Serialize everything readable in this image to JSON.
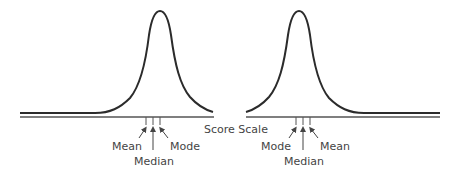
{
  "diagram": {
    "axis_label": "Score Scale",
    "colors": {
      "curve": "#2b2b2b",
      "axis": "#555555",
      "text": "#444444"
    },
    "left": {
      "skew": "negative",
      "labels": {
        "a": "Mean",
        "b": "Median",
        "c": "Mode"
      }
    },
    "right": {
      "skew": "positive",
      "labels": {
        "a": "Mode",
        "b": "Median",
        "c": "Mean"
      }
    }
  }
}
